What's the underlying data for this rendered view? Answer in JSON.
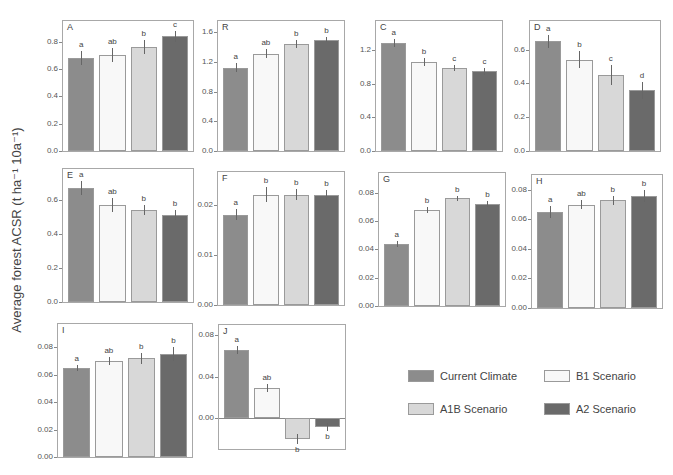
{
  "chart_data": {
    "type": "bar",
    "ylabel": "Average  forest ACSR (t ha⁻¹ 10a⁻¹)",
    "series_names": [
      "Current Climate",
      "B1 Scenario",
      "A1B Scenario",
      "A2 Scenario"
    ],
    "colors": [
      "#8c8c8c",
      "#f8f8f8",
      "#d8d8d8",
      "#6a6a6a"
    ],
    "panels": [
      {
        "label": "A",
        "ylim": [
          0,
          0.95
        ],
        "ticks": [
          "0.0",
          "0.2",
          "0.4",
          "0.6",
          "0.8"
        ],
        "tickvals": [
          0,
          0.2,
          0.4,
          0.6,
          0.8
        ],
        "values": [
          0.68,
          0.7,
          0.76,
          0.84
        ],
        "errors": [
          0.05,
          0.05,
          0.05,
          0.04
        ],
        "sig": [
          "a",
          "ab",
          "b",
          "c"
        ]
      },
      {
        "label": "R",
        "ylim": [
          0,
          1.75
        ],
        "ticks": [
          "0.0",
          "0.4",
          "0.8",
          "1.2",
          "1.6"
        ],
        "tickvals": [
          0,
          0.4,
          0.8,
          1.2,
          1.6
        ],
        "values": [
          1.12,
          1.31,
          1.44,
          1.5
        ],
        "errors": [
          0.06,
          0.06,
          0.06,
          0.03
        ],
        "sig": [
          "a",
          "ab",
          "b",
          "b"
        ]
      },
      {
        "label": "C",
        "ylim": [
          0,
          1.55
        ],
        "ticks": [
          "0.0",
          "0.4",
          "0.8",
          "1.2"
        ],
        "tickvals": [
          0,
          0.4,
          0.8,
          1.2
        ],
        "values": [
          1.29,
          1.06,
          0.99,
          0.95
        ],
        "errors": [
          0.05,
          0.05,
          0.04,
          0.04
        ],
        "sig": [
          "a",
          "b",
          "c",
          "c"
        ]
      },
      {
        "label": "D",
        "ylim": [
          0,
          0.77
        ],
        "ticks": [
          "0.0",
          "0.2",
          "0.4",
          "0.6"
        ],
        "tickvals": [
          0,
          0.2,
          0.4,
          0.6
        ],
        "values": [
          0.65,
          0.54,
          0.45,
          0.36
        ],
        "errors": [
          0.04,
          0.05,
          0.06,
          0.05
        ],
        "sig": [
          "a",
          "b",
          "c",
          "d"
        ]
      },
      {
        "label": "E",
        "ylim": [
          0,
          0.78
        ],
        "ticks": [
          "0.0",
          "0.2",
          "0.4",
          "0.6"
        ],
        "tickvals": [
          0,
          0.2,
          0.4,
          0.6
        ],
        "values": [
          0.67,
          0.57,
          0.54,
          0.51
        ],
        "errors": [
          0.04,
          0.04,
          0.03,
          0.03
        ],
        "sig": [
          "a",
          "ab",
          "b",
          "b"
        ]
      },
      {
        "label": "F",
        "ylim": [
          0,
          0.0265
        ],
        "ticks": [
          "0.00",
          "0.01",
          "0.02"
        ],
        "tickvals": [
          0,
          0.01,
          0.02
        ],
        "values": [
          0.018,
          0.022,
          0.022,
          0.022
        ],
        "errors": [
          0.0011,
          0.0015,
          0.0011,
          0.001
        ],
        "sig": [
          "a",
          "b",
          "b",
          "b"
        ]
      },
      {
        "label": "G",
        "ylim": [
          0,
          0.094
        ],
        "ticks": [
          "0.00",
          "0.02",
          "0.04",
          "0.06",
          "0.08"
        ],
        "tickvals": [
          0,
          0.02,
          0.04,
          0.06,
          0.08
        ],
        "values": [
          0.044,
          0.068,
          0.076,
          0.072
        ],
        "errors": [
          0.002,
          0.002,
          0.002,
          0.002
        ],
        "sig": [
          "a",
          "b",
          "b",
          "b"
        ]
      },
      {
        "label": "H",
        "ylim": [
          0,
          0.09
        ],
        "ticks": [
          "0.00",
          "0.02",
          "0.04",
          "0.06",
          "0.08"
        ],
        "tickvals": [
          0,
          0.02,
          0.04,
          0.06,
          0.08
        ],
        "values": [
          0.065,
          0.07,
          0.073,
          0.076
        ],
        "errors": [
          0.004,
          0.003,
          0.003,
          0.004
        ],
        "sig": [
          "a",
          "ab",
          "b",
          "b"
        ]
      },
      {
        "label": "I",
        "ylim": [
          0,
          0.097
        ],
        "ticks": [
          "0.00",
          "0.02",
          "0.04",
          "0.06",
          "0.08"
        ],
        "tickvals": [
          0,
          0.02,
          0.04,
          0.06,
          0.08
        ],
        "values": [
          0.065,
          0.07,
          0.072,
          0.075
        ],
        "errors": [
          0.002,
          0.003,
          0.004,
          0.005
        ],
        "sig": [
          "a",
          "ab",
          "b",
          "b"
        ]
      },
      {
        "label": "J",
        "ylim": [
          -0.03,
          0.09
        ],
        "ticks": [
          "0.00",
          "0.04",
          "0.08"
        ],
        "tickvals": [
          0,
          0.04,
          0.08
        ],
        "values": [
          0.066,
          0.029,
          -0.02,
          -0.009
        ],
        "errors": [
          0.004,
          0.004,
          0.005,
          0.004
        ],
        "sig": [
          "a",
          "ab",
          "b",
          "b"
        ]
      }
    ],
    "legend_position": "bottom-right"
  },
  "legend": {
    "items": [
      {
        "label": "Current Climate",
        "color": "#8c8c8c"
      },
      {
        "label": "B1 Scenario",
        "color": "#f8f8f8"
      },
      {
        "label": "A1B Scenario",
        "color": "#d8d8d8"
      },
      {
        "label": "A2 Scenario",
        "color": "#6a6a6a"
      }
    ]
  }
}
